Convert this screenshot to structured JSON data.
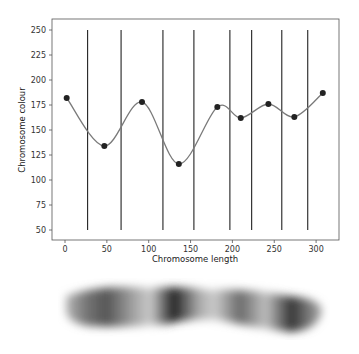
{
  "chart_data": {
    "type": "line",
    "title": "",
    "xlabel": "Chromosome length",
    "ylabel": "Chromosome colour",
    "xlim": [
      -10,
      325
    ],
    "ylim": [
      40,
      260
    ],
    "xticks": [
      0,
      50,
      100,
      150,
      200,
      250,
      300
    ],
    "yticks": [
      50,
      75,
      100,
      125,
      150,
      175,
      200,
      225,
      250
    ],
    "grid": false,
    "legend": null,
    "series": [
      {
        "name": "colour profile (smoothed)",
        "style": "line+markers",
        "color": "#777777",
        "marker_color": "#222222",
        "x": [
          2,
          47,
          92,
          136,
          182,
          210,
          243,
          274,
          308
        ],
        "y": [
          182,
          134,
          178,
          116,
          173,
          162,
          176,
          163,
          187
        ]
      }
    ],
    "vlines": {
      "color": "#222222",
      "ymin": 50,
      "ymax": 250,
      "x": [
        27,
        67,
        117,
        154,
        197,
        223,
        259,
        290
      ]
    }
  },
  "band_image": {
    "description": "blurred grayscale chromosome banding image",
    "bands": [
      {
        "x": 0.0,
        "shade": 0.25
      },
      {
        "x": 0.08,
        "shade": 0.55
      },
      {
        "x": 0.16,
        "shade": 0.7
      },
      {
        "x": 0.26,
        "shade": 0.35
      },
      {
        "x": 0.33,
        "shade": 0.15
      },
      {
        "x": 0.42,
        "shade": 0.95
      },
      {
        "x": 0.52,
        "shade": 0.3
      },
      {
        "x": 0.58,
        "shade": 0.15
      },
      {
        "x": 0.68,
        "shade": 0.6
      },
      {
        "x": 0.78,
        "shade": 0.2
      },
      {
        "x": 0.88,
        "shade": 0.85
      },
      {
        "x": 1.0,
        "shade": 0.3
      }
    ]
  }
}
